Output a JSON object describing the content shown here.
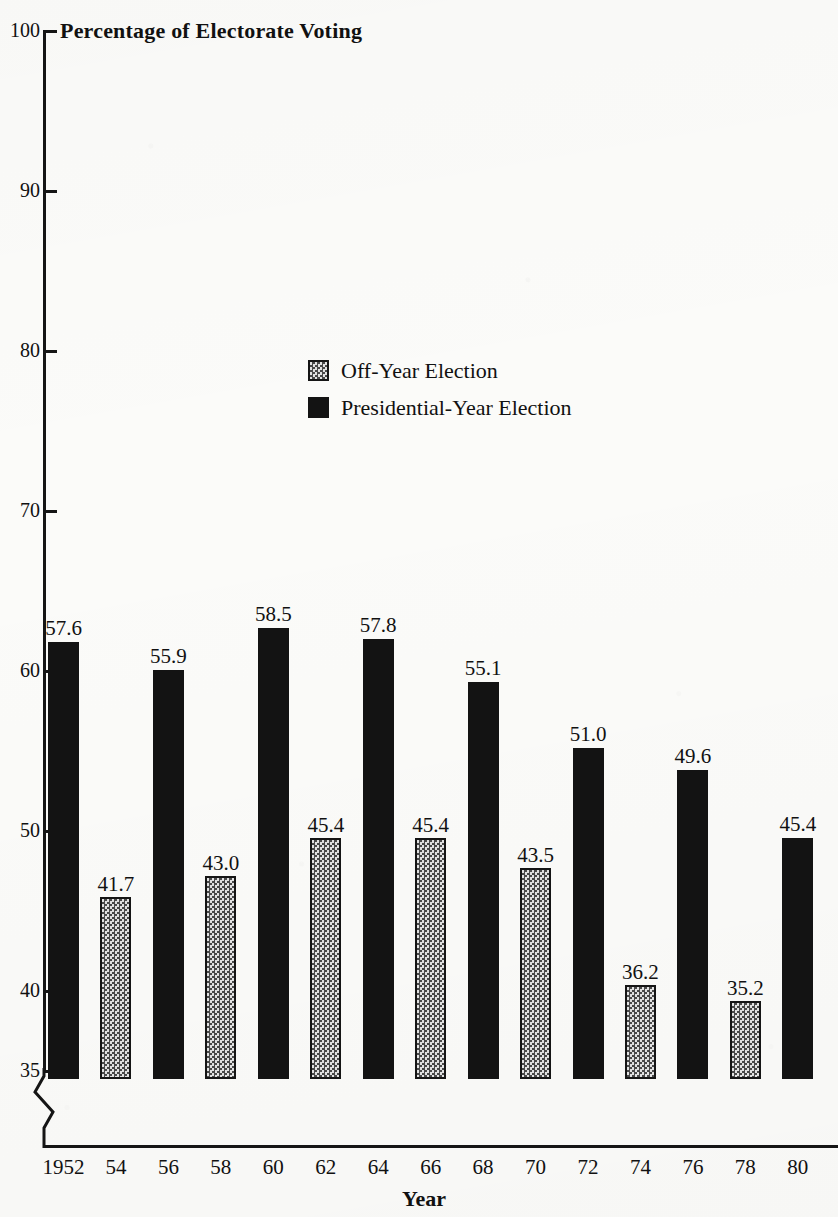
{
  "chart_data": {
    "type": "bar",
    "title": "Percentage of Electorate Voting",
    "xlabel": "Year",
    "ylabel": "",
    "ylim": [
      33,
      100
    ],
    "grid": false,
    "axis_break": "below 35",
    "legend_position": "inside-top-center",
    "y_ticks": [
      100,
      90,
      80,
      70,
      60,
      50,
      40,
      35
    ],
    "categories": [
      "1952",
      "54",
      "56",
      "58",
      "60",
      "62",
      "64",
      "66",
      "68",
      "70",
      "72",
      "74",
      "76",
      "78",
      "80"
    ],
    "values": [
      57.6,
      41.7,
      55.9,
      43.0,
      58.5,
      45.4,
      57.8,
      45.4,
      55.1,
      43.5,
      51.0,
      36.2,
      49.6,
      35.2,
      45.4
    ],
    "value_labels": [
      "57.6",
      "41.7",
      "55.9",
      "43.0",
      "58.5",
      "45.4",
      "57.8",
      "45.4",
      "55.1",
      "43.5",
      "51.0",
      "36.2",
      "49.6",
      "35.2",
      "45.4"
    ],
    "bar_types": [
      "presidential",
      "offyear",
      "presidential",
      "offyear",
      "presidential",
      "offyear",
      "presidential",
      "offyear",
      "presidential",
      "offyear",
      "presidential",
      "offyear",
      "presidential",
      "offyear",
      "presidential"
    ],
    "series": [
      {
        "name": "Off-Year Election",
        "style": "offyear",
        "points": [
          {
            "year": "54",
            "value": 41.7
          },
          {
            "year": "58",
            "value": 43.0
          },
          {
            "year": "62",
            "value": 45.4
          },
          {
            "year": "66",
            "value": 45.4
          },
          {
            "year": "70",
            "value": 43.5
          },
          {
            "year": "74",
            "value": 36.2
          },
          {
            "year": "78",
            "value": 35.2
          }
        ]
      },
      {
        "name": "Presidential-Year Election",
        "style": "presidential",
        "points": [
          {
            "year": "1952",
            "value": 57.6
          },
          {
            "year": "56",
            "value": 55.9
          },
          {
            "year": "60",
            "value": 58.5
          },
          {
            "year": "64",
            "value": 57.8
          },
          {
            "year": "68",
            "value": 55.1
          },
          {
            "year": "72",
            "value": 51.0
          },
          {
            "year": "76",
            "value": 49.6
          },
          {
            "year": "80",
            "value": 45.4
          }
        ]
      }
    ],
    "legend": [
      {
        "label": "Off-Year Election",
        "style": "offyear"
      },
      {
        "label": "Presidential-Year Election",
        "style": "presidential"
      }
    ],
    "colors": {
      "presidential": "#131313",
      "offyear_fill": "#c9c9c9",
      "offyear_outline": "#151515",
      "axis": "#151515",
      "background": "#fbfbf9",
      "text": "#111111"
    }
  }
}
